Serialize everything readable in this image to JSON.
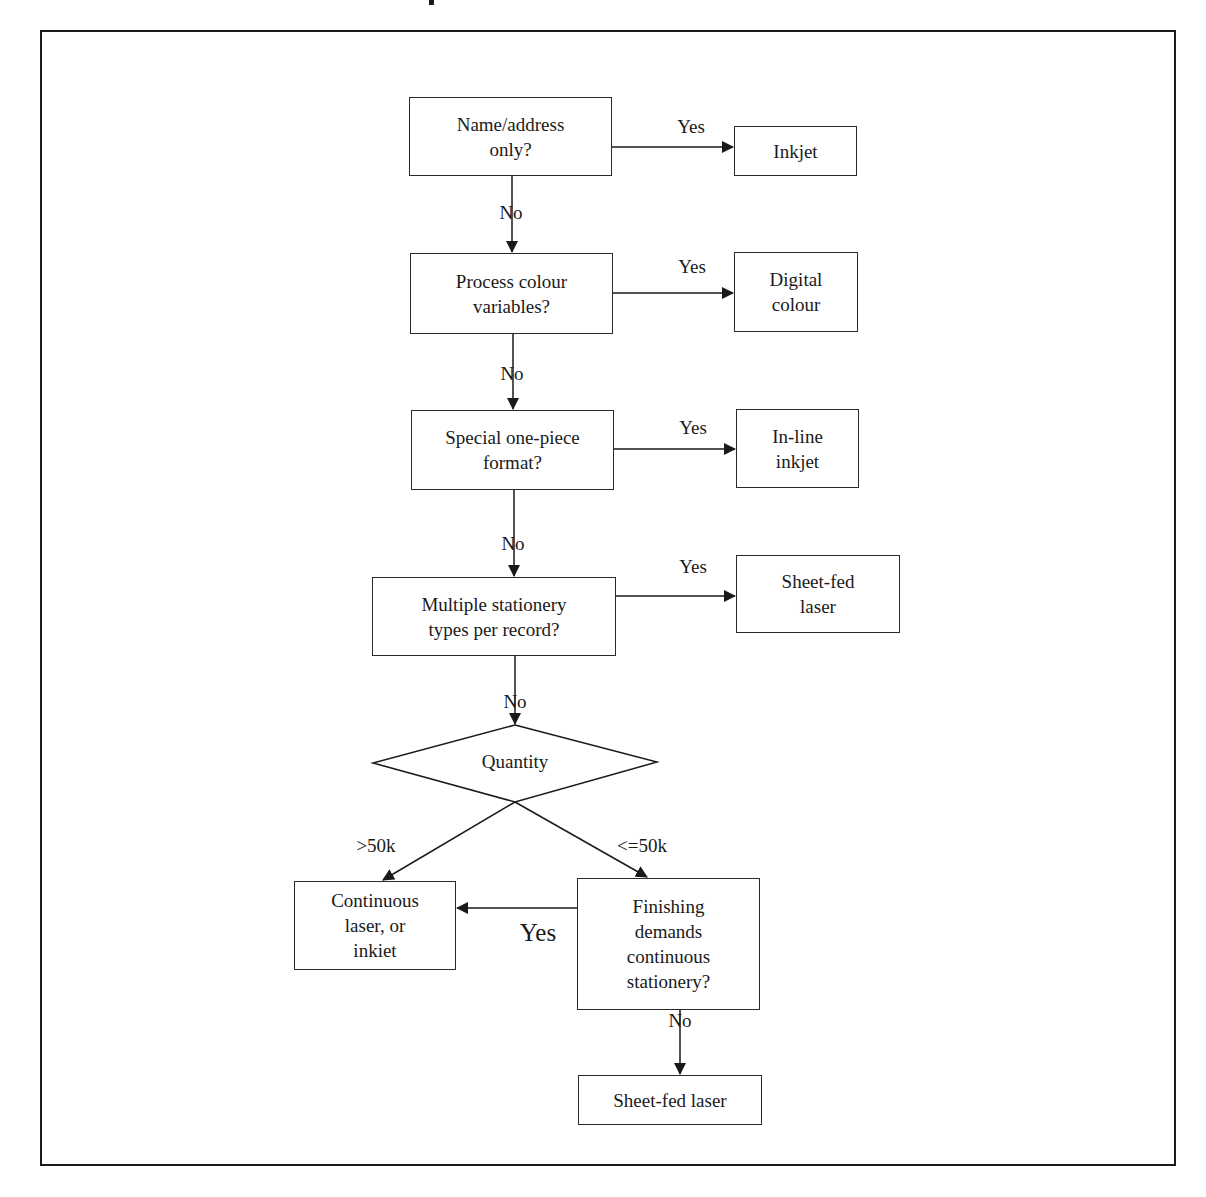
{
  "diagram": {
    "type": "flowchart",
    "colors": {
      "stroke": "#1a1a1a",
      "background": "#ffffff"
    },
    "decisions": {
      "d1": {
        "text": "Name/address\nonly?"
      },
      "d2": {
        "text": "Process colour\nvariables?"
      },
      "d3": {
        "text": "Special one-piece\nformat?"
      },
      "d4": {
        "text": "Multiple stationery\ntypes per record?"
      },
      "quantity": {
        "text": "Quantity"
      },
      "finishing": {
        "text": "Finishing\ndemands\ncontinuous\nstationery?"
      }
    },
    "outcomes": {
      "inkjet": {
        "text": "Inkjet"
      },
      "digital_colour": {
        "text": "Digital\ncolour"
      },
      "inline_inkjet": {
        "text": "In-line\ninkjet"
      },
      "sheetfed_laser_1": {
        "text": "Sheet-fed\nlaser"
      },
      "continuous": {
        "text": "Continuous\nlaser, or\ninkiet"
      },
      "sheetfed_laser_2": {
        "text": "Sheet-fed laser"
      }
    },
    "edge_labels": {
      "yes1": "Yes",
      "no1": "No",
      "yes2": "Yes",
      "no2": "No",
      "yes3": "Yes",
      "no3": "No",
      "yes4": "Yes",
      "no4": "No",
      "gt50k": ">50k",
      "le50k": "<=50k",
      "yes_finishing": "Yes",
      "no_finishing": "No"
    }
  }
}
